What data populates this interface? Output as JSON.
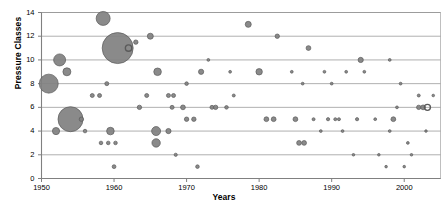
{
  "chart_data": {
    "type": "scatter",
    "title": "",
    "xlabel": "Years",
    "ylabel": "Pressure Classes",
    "xlim": [
      1950,
      2005
    ],
    "ylim": [
      0,
      14
    ],
    "xticks": [
      1950,
      1960,
      1970,
      1980,
      1990,
      2000
    ],
    "yticks": [
      0,
      2,
      4,
      6,
      8,
      10,
      12,
      14
    ],
    "grid": "horizontal",
    "legend": "none",
    "marker_color": "#808080",
    "marker_stroke": "#5a5a5a",
    "axis_color": "#808080",
    "note": "Bubble sizes encode a third variable (count/frequency); one marker near 1962 at y=11 is drawn hollow (open ring).",
    "points": [
      {
        "x": 1951.0,
        "y": 8,
        "size": 9.5
      },
      {
        "x": 1952.5,
        "y": 10,
        "size": 6.0
      },
      {
        "x": 1953.5,
        "y": 9,
        "size": 4.0
      },
      {
        "x": 1952.0,
        "y": 4,
        "size": 3.6
      },
      {
        "x": 1954.0,
        "y": 5,
        "size": 12.5
      },
      {
        "x": 1955.5,
        "y": 5,
        "size": 2.2
      },
      {
        "x": 1956.0,
        "y": 4,
        "size": 1.8
      },
      {
        "x": 1957.0,
        "y": 7,
        "size": 2.0
      },
      {
        "x": 1958.0,
        "y": 7,
        "size": 2.0
      },
      {
        "x": 1958.2,
        "y": 3,
        "size": 1.8
      },
      {
        "x": 1959.2,
        "y": 3,
        "size": 1.8
      },
      {
        "x": 1960.2,
        "y": 3,
        "size": 1.8
      },
      {
        "x": 1959.0,
        "y": 8,
        "size": 2.0
      },
      {
        "x": 1959.5,
        "y": 4,
        "size": 3.8
      },
      {
        "x": 1960.0,
        "y": 1,
        "size": 1.9
      },
      {
        "x": 1958.5,
        "y": 13.5,
        "size": 7.0
      },
      {
        "x": 1960.5,
        "y": 11,
        "size": 15.5
      },
      {
        "x": 1962.0,
        "y": 11,
        "size": 3.2,
        "hollow": true
      },
      {
        "x": 1963.5,
        "y": 6,
        "size": 2.2
      },
      {
        "x": 1964.5,
        "y": 7,
        "size": 2.0
      },
      {
        "x": 1963.0,
        "y": 11.5,
        "size": 2.2
      },
      {
        "x": 1965.0,
        "y": 12,
        "size": 3.0
      },
      {
        "x": 1966.0,
        "y": 9,
        "size": 3.8
      },
      {
        "x": 1965.8,
        "y": 4,
        "size": 4.5
      },
      {
        "x": 1965.8,
        "y": 3,
        "size": 4.2
      },
      {
        "x": 1967.5,
        "y": 7,
        "size": 2.0
      },
      {
        "x": 1968.2,
        "y": 7,
        "size": 2.0
      },
      {
        "x": 1967.5,
        "y": 4,
        "size": 2.6
      },
      {
        "x": 1968.0,
        "y": 6,
        "size": 2.0
      },
      {
        "x": 1969.5,
        "y": 6,
        "size": 2.4
      },
      {
        "x": 1970.0,
        "y": 5,
        "size": 2.2
      },
      {
        "x": 1971.0,
        "y": 5,
        "size": 2.2
      },
      {
        "x": 1968.5,
        "y": 2,
        "size": 1.6
      },
      {
        "x": 1971.5,
        "y": 1,
        "size": 1.8
      },
      {
        "x": 1970.0,
        "y": 8,
        "size": 1.8
      },
      {
        "x": 1972.0,
        "y": 9,
        "size": 2.6
      },
      {
        "x": 1973.5,
        "y": 6,
        "size": 2.0
      },
      {
        "x": 1974.0,
        "y": 6,
        "size": 2.2
      },
      {
        "x": 1975.5,
        "y": 6,
        "size": 1.8
      },
      {
        "x": 1976.5,
        "y": 7,
        "size": 1.5
      },
      {
        "x": 1978.5,
        "y": 13,
        "size": 3.0
      },
      {
        "x": 1980.0,
        "y": 9,
        "size": 3.2
      },
      {
        "x": 1981.0,
        "y": 5,
        "size": 2.4
      },
      {
        "x": 1982.0,
        "y": 5,
        "size": 2.4
      },
      {
        "x": 1982.5,
        "y": 12,
        "size": 2.2
      },
      {
        "x": 1985.0,
        "y": 5,
        "size": 2.4
      },
      {
        "x": 1985.5,
        "y": 3,
        "size": 2.4
      },
      {
        "x": 1986.2,
        "y": 3,
        "size": 2.4
      },
      {
        "x": 1986.8,
        "y": 11,
        "size": 2.4
      },
      {
        "x": 1987.5,
        "y": 5,
        "size": 1.5
      },
      {
        "x": 1988.5,
        "y": 4,
        "size": 1.4
      },
      {
        "x": 1989.5,
        "y": 5,
        "size": 1.6
      },
      {
        "x": 1990.5,
        "y": 5,
        "size": 1.5
      },
      {
        "x": 1991.0,
        "y": 5,
        "size": 1.5
      },
      {
        "x": 1991.5,
        "y": 4,
        "size": 1.4
      },
      {
        "x": 1993.0,
        "y": 2,
        "size": 1.3
      },
      {
        "x": 1993.5,
        "y": 5,
        "size": 1.6
      },
      {
        "x": 1994.0,
        "y": 10,
        "size": 2.6
      },
      {
        "x": 1996.0,
        "y": 5,
        "size": 1.4
      },
      {
        "x": 1996.5,
        "y": 2,
        "size": 1.3
      },
      {
        "x": 1997.5,
        "y": 1,
        "size": 1.3
      },
      {
        "x": 1998.5,
        "y": 5,
        "size": 2.4
      },
      {
        "x": 1998.0,
        "y": 4,
        "size": 1.4
      },
      {
        "x": 1999.0,
        "y": 6,
        "size": 1.4
      },
      {
        "x": 2000.0,
        "y": 1,
        "size": 1.3
      },
      {
        "x": 2000.5,
        "y": 3,
        "size": 1.4
      },
      {
        "x": 2002.0,
        "y": 6,
        "size": 2.2
      },
      {
        "x": 2002.6,
        "y": 6,
        "size": 2.4
      },
      {
        "x": 2003.2,
        "y": 6,
        "size": 3.0,
        "hollow": true
      },
      {
        "x": 2002.0,
        "y": 7,
        "size": 1.5
      },
      {
        "x": 2001.0,
        "y": 2,
        "size": 1.3
      },
      {
        "x": 2003.0,
        "y": 4,
        "size": 1.3
      },
      {
        "x": 2004.0,
        "y": 7,
        "size": 1.3
      },
      {
        "x": 1999.5,
        "y": 8,
        "size": 1.4
      },
      {
        "x": 1989.0,
        "y": 9,
        "size": 1.4
      },
      {
        "x": 1992.0,
        "y": 9,
        "size": 1.4
      },
      {
        "x": 1994.5,
        "y": 9,
        "size": 1.4
      },
      {
        "x": 1984.5,
        "y": 9,
        "size": 1.4
      },
      {
        "x": 1986.0,
        "y": 8,
        "size": 1.4
      },
      {
        "x": 1990.0,
        "y": 8,
        "size": 1.4
      },
      {
        "x": 1976.0,
        "y": 9,
        "size": 1.4
      },
      {
        "x": 1998.0,
        "y": 10,
        "size": 1.4
      },
      {
        "x": 1973.0,
        "y": 10,
        "size": 1.4
      }
    ]
  },
  "axes": {
    "y_title": "Pressure Classes",
    "x_title": "Years",
    "y_tick_labels": [
      "0",
      "2",
      "4",
      "6",
      "8",
      "10",
      "12",
      "14"
    ],
    "x_tick_labels": [
      "1950",
      "1960",
      "1970",
      "1980",
      "1990",
      "2000"
    ]
  }
}
